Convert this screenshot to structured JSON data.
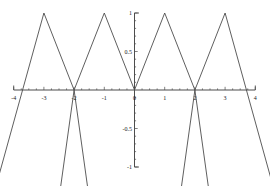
{
  "chart_data": {
    "type": "line",
    "title": "",
    "subtitle": "",
    "xlabel": "",
    "ylabel": "",
    "xlim": [
      -4,
      4
    ],
    "ylim": [
      -1,
      1
    ],
    "grid": false,
    "legend": null,
    "annotations": [],
    "x_ticks": [
      {
        "value": -4,
        "label": "-4"
      },
      {
        "value": -3,
        "label": "-3"
      },
      {
        "value": -2,
        "label": "-2"
      },
      {
        "value": -1,
        "label": "-1"
      },
      {
        "value": 0,
        "label": "0"
      },
      {
        "value": 1,
        "label": "1"
      },
      {
        "value": 2,
        "label": "2"
      },
      {
        "value": 3,
        "label": "3"
      },
      {
        "value": 4,
        "label": "4"
      }
    ],
    "y_ticks": [
      {
        "value": 1,
        "label": "1"
      },
      {
        "value": 0.5,
        "label": "0.5"
      },
      {
        "value": -0.5,
        "label": "-0.5"
      },
      {
        "value": -1,
        "label": "-1"
      }
    ],
    "x_minor_tick_step": 0.25,
    "y_minor_tick_step": 0.1,
    "series": [
      {
        "name": "triangle-wave",
        "color": "#4d4d4d",
        "x": [
          -4.8,
          -4,
          -3,
          -2,
          -1,
          0,
          1,
          2,
          3,
          4,
          4.8
        ],
        "y": [
          -1.6,
          0.0,
          1.0,
          0.0,
          1.0,
          0.0,
          1.0,
          0.0,
          1.0,
          0.0,
          -1.6
        ],
        "note": "piecewise-linear V / inverted-V segments, period 2, amplitude 1"
      }
    ],
    "segments": [
      {
        "name": "seg-far-left-up",
        "x0": -4.8,
        "y0": -1.55,
        "x1": -3.0,
        "y1": 1.0
      },
      {
        "name": "seg-left-outer-down",
        "x0": -3.0,
        "y0": 1.0,
        "x1": -2.0,
        "y1": 0.0
      },
      {
        "name": "seg-left-trough-down",
        "x0": -2.0,
        "y0": 0.0,
        "x1": -1.45,
        "y1": -1.55
      },
      {
        "name": "seg-left-trough-up",
        "x0": -2.0,
        "y0": 0.0,
        "x1": -2.55,
        "y1": -1.55
      },
      {
        "name": "seg-left-inner-up",
        "x0": -2.0,
        "y0": 0.0,
        "x1": -1.0,
        "y1": 1.0
      },
      {
        "name": "seg-origin-left-down",
        "x0": -1.0,
        "y0": 1.0,
        "x1": 0.0,
        "y1": 0.0
      },
      {
        "name": "seg-origin-right-up",
        "x0": 0.0,
        "y0": 0.0,
        "x1": 1.0,
        "y1": 1.0
      },
      {
        "name": "seg-right-inner-down",
        "x0": 1.0,
        "y0": 1.0,
        "x1": 2.0,
        "y1": 0.0
      },
      {
        "name": "seg-right-trough-up",
        "x0": 2.0,
        "y0": 0.0,
        "x1": 1.45,
        "y1": -1.55
      },
      {
        "name": "seg-right-trough-down",
        "x0": 2.0,
        "y0": 0.0,
        "x1": 2.55,
        "y1": -1.55
      },
      {
        "name": "seg-right-outer-up",
        "x0": 2.0,
        "y0": 0.0,
        "x1": 3.0,
        "y1": 1.0
      },
      {
        "name": "seg-far-right-down",
        "x0": 3.0,
        "y0": 1.0,
        "x1": 4.8,
        "y1": -1.55
      }
    ],
    "axis_color": "#4d4d4d",
    "curve_color": "#4d4d4d",
    "background_color": "#ffffff"
  }
}
